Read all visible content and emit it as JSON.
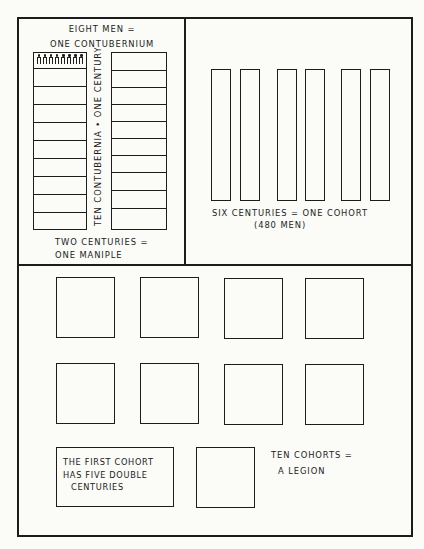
{
  "diagram": {
    "panel_top_left": {
      "caption_top": [
        "EIGHT MEN =",
        "ONE CONTUBERNIUM"
      ],
      "vertical_caption": "TEN CONTUBERNIA • ONE CENTURY",
      "caption_bottom": [
        "TWO CENTURIES =",
        "ONE MANIPLE"
      ],
      "centuries": [
        {
          "name": "century-left",
          "contubernia": 10,
          "first_cell_men": 8
        },
        {
          "name": "century-right",
          "contubernia": 10,
          "first_cell_men": 0
        }
      ]
    },
    "panel_top_right": {
      "centuries_count": 6,
      "caption": [
        "SIX CENTURIES = ONE COHORT",
        "(480 MEN)"
      ]
    },
    "panel_bottom": {
      "cohort_rows": [
        4,
        4
      ],
      "first_cohort_label": [
        "THE FIRST COHORT",
        "HAS FIVE DOUBLE",
        "CENTURIES"
      ],
      "extra_cohort_count": 1,
      "legion_caption": [
        "TEN COHORTS =",
        "A LEGION"
      ]
    },
    "colors": {
      "ink": "#1c1c1c",
      "paper": "#fbfbf8"
    }
  }
}
